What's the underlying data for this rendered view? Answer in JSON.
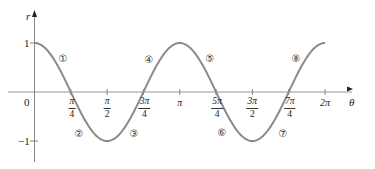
{
  "chart_data": {
    "type": "line",
    "title": "",
    "function": "r = cos(2θ)",
    "xlabel": "θ",
    "ylabel": "r",
    "xlim": [
      0,
      6.2832
    ],
    "ylim": [
      -1.5,
      1.5
    ],
    "grid": false,
    "legend": null,
    "x_ticks": [
      {
        "value": 0.7854,
        "num": "π",
        "den": "4",
        "label": "π/4"
      },
      {
        "value": 1.5708,
        "num": "π",
        "den": "2",
        "label": "π/2"
      },
      {
        "value": 2.3562,
        "num": "3π",
        "den": "4",
        "label": "3π/4"
      },
      {
        "value": 3.1416,
        "text": "π",
        "label": "π"
      },
      {
        "value": 3.927,
        "num": "5π",
        "den": "4",
        "label": "5π/4"
      },
      {
        "value": 4.7124,
        "num": "3π",
        "den": "2",
        "label": "3π/2"
      },
      {
        "value": 5.4978,
        "num": "7π",
        "den": "4",
        "label": "7π/4"
      },
      {
        "value": 6.2832,
        "text": "2π",
        "label": "2π"
      }
    ],
    "y_ticks": [
      {
        "value": 1,
        "label": "1"
      },
      {
        "value": -1,
        "label": "−1"
      }
    ],
    "origin_label": "0",
    "series": [
      {
        "name": "r = cos 2θ",
        "x": [
          0,
          0.3927,
          0.7854,
          1.1781,
          1.5708,
          1.9635,
          2.3562,
          2.7489,
          3.1416,
          3.5343,
          3.927,
          4.3197,
          4.7124,
          5.1051,
          5.4978,
          5.8905,
          6.2832
        ],
        "values": [
          1,
          0.707,
          0,
          -0.707,
          -1,
          -0.707,
          0,
          0.707,
          1,
          0.707,
          0,
          -0.707,
          -1,
          -0.707,
          0,
          0.707,
          1
        ],
        "color": "#8a8a8a"
      }
    ],
    "annotations": [
      {
        "text": "①",
        "theta_region": "0 to π/4",
        "x_px": 63,
        "y_px": 58
      },
      {
        "text": "②",
        "theta_region": "π/4 to π/2",
        "x_px": 79,
        "y_px": 133
      },
      {
        "text": "③",
        "theta_region": "π/2 to 3π/4",
        "x_px": 134,
        "y_px": 133
      },
      {
        "text": "④",
        "theta_region": "3π/4 to π",
        "x_px": 149,
        "y_px": 59
      },
      {
        "text": "⑤",
        "theta_region": "π to 5π/4",
        "x_px": 210,
        "y_px": 58
      },
      {
        "text": "⑥",
        "theta_region": "5π/4 to 3π/2",
        "x_px": 222,
        "y_px": 132
      },
      {
        "text": "⑦",
        "theta_region": "3π/2 to 7π/4",
        "x_px": 283,
        "y_px": 133
      },
      {
        "text": "⑧",
        "theta_region": "7π/4 to 2π",
        "x_px": 296,
        "y_px": 58
      }
    ]
  },
  "colors": {
    "curve": "#8a8a8a",
    "axis": "#7a7a7a",
    "text": "#222222"
  }
}
